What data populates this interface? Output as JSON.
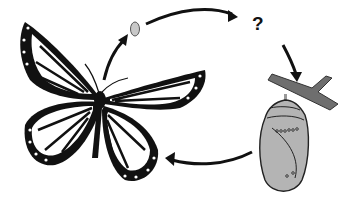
{
  "diagram": {
    "type": "life-cycle",
    "stages": [
      {
        "id": "adult",
        "label": "butterfly"
      },
      {
        "id": "egg",
        "label": "egg"
      },
      {
        "id": "unknown",
        "label": "?"
      },
      {
        "id": "pupa",
        "label": "chrysalis"
      }
    ],
    "edges": [
      {
        "from": "adult",
        "to": "egg"
      },
      {
        "from": "egg",
        "to": "unknown"
      },
      {
        "from": "unknown",
        "to": "pupa"
      },
      {
        "from": "pupa",
        "to": "adult"
      }
    ],
    "missing_stage_label": "?"
  },
  "colors": {
    "background": "#ffffff",
    "ink": "#111111",
    "egg": "#c8c8c8",
    "chrysalis": "#b4b4b4",
    "branch": "#6e6e6e"
  }
}
